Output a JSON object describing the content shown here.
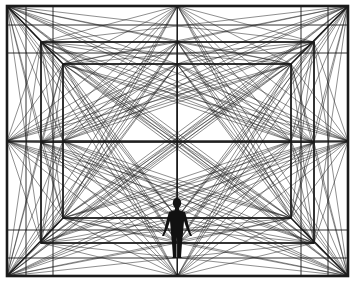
{
  "artwork": {
    "title": "Geometric perspective room with human figure",
    "background": "#ffffff",
    "ink": "#1a1a1a",
    "canvas": {
      "width": 355,
      "height": 284
    },
    "frames": [
      {
        "name": "outer-frame",
        "x1": 7,
        "y1": 6,
        "x2": 348,
        "y2": 276,
        "stroke_width": 2.6
      },
      {
        "name": "middle-frame",
        "x1": 41,
        "y1": 42,
        "x2": 314,
        "y2": 243,
        "stroke_width": 1.6
      },
      {
        "name": "inner-frame",
        "x1": 63,
        "y1": 64,
        "x2": 291,
        "y2": 218,
        "stroke_width": 1.6
      }
    ],
    "center": {
      "x": 177,
      "y": 142
    },
    "extra_horizontals": [
      25,
      53,
      230,
      258
    ],
    "extra_verticals": [
      26,
      53,
      301,
      328
    ],
    "net_stroke_width": 0.9,
    "figure": {
      "name": "human-figure",
      "cx": 177,
      "head_cy": 203,
      "head_r": 4.2,
      "foot_y": 258
    }
  }
}
